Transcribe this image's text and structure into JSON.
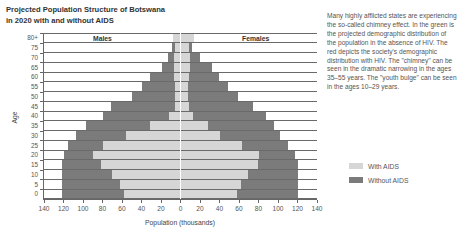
{
  "header": {
    "title_line1": "Projected Population Structure of Botswana",
    "title_line2": "in 2020 with and without AIDS"
  },
  "description": "Many highly afflicted states are experiencing the so-called chimney effect. In the green is the projected demographic distribution of the population in the absence of HIV. The red depicts the society's demographic distribution with HIV. The \"chimney\" can be seen in the dramatic narrowing in the ages 35–55 years. The \"youth bulge\" can be seen in the ages 10–29 years.",
  "legend": {
    "items": [
      {
        "label": "With AIDS",
        "color": "#d6d6d6"
      },
      {
        "label": "Without AIDS",
        "color": "#7b7b7b"
      }
    ]
  },
  "chart_data": {
    "type": "bar",
    "subtype": "population-pyramid",
    "title": "Projected Population Structure of Botswana in 2020 with and without AIDS",
    "xlabel": "Population (thousands)",
    "ylabel": "Age",
    "side_labels": {
      "left": "Males",
      "right": "Females"
    },
    "xlim": [
      -140,
      140
    ],
    "x_ticks": [
      140,
      120,
      100,
      80,
      60,
      40,
      20,
      0,
      20,
      40,
      60,
      80,
      100,
      120,
      140
    ],
    "categories": [
      "80+",
      "75",
      "70",
      "65",
      "60",
      "55",
      "50",
      "45",
      "40",
      "35",
      "30",
      "25",
      "20",
      "15",
      "10",
      "5",
      "0"
    ],
    "series": [
      {
        "name": "Without AIDS",
        "sex": "Males",
        "values": [
          8,
          9,
          13,
          19,
          31,
          40,
          50,
          71,
          80,
          97,
          107,
          115,
          120,
          122,
          122,
          122,
          122
        ]
      },
      {
        "name": "With AIDS",
        "sex": "Males",
        "values": [
          8,
          6,
          7,
          7,
          7,
          6,
          6,
          6,
          12,
          31,
          56,
          80,
          90,
          82,
          70,
          62,
          58
        ]
      },
      {
        "name": "Without AIDS",
        "sex": "Females",
        "values": [
          14,
          12,
          20,
          32,
          39,
          49,
          59,
          74,
          88,
          96,
          102,
          110,
          117,
          120,
          120,
          120,
          120
        ]
      },
      {
        "name": "With AIDS",
        "sex": "Females",
        "values": [
          14,
          9,
          10,
          10,
          9,
          8,
          8,
          9,
          13,
          28,
          40,
          63,
          81,
          79,
          69,
          62,
          58
        ]
      }
    ],
    "grid": true,
    "legend_position": "right"
  }
}
